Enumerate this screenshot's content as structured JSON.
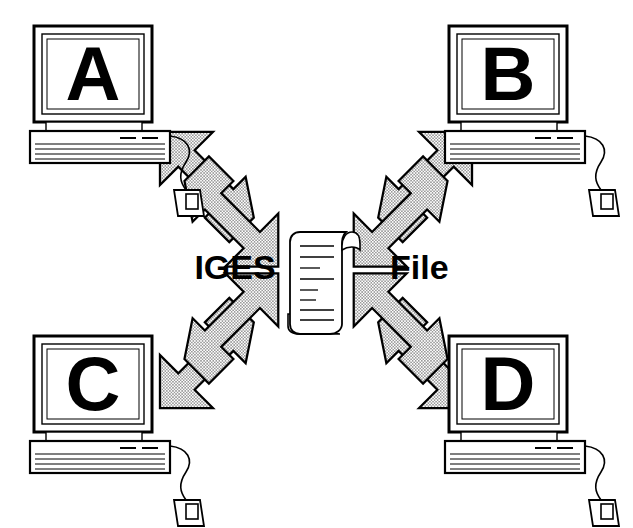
{
  "diagram": {
    "background_color": "#ffffff",
    "ink_color": "#000000",
    "arrow_fill_color": "#d8d8d8",
    "arrow_pattern": "halftone-dots",
    "labels": {
      "left": "IGES",
      "right": "File"
    },
    "center_icon": {
      "name": "scroll-document-icon",
      "description": "curled paper scroll with text lines",
      "text_line_count": 8
    },
    "nodes": [
      {
        "id": "A",
        "screen_letter": "A",
        "name": "computer-a",
        "position": "top-left",
        "x": 28,
        "y": 24,
        "has_mouse": true,
        "has_keyboard_base": true
      },
      {
        "id": "B",
        "screen_letter": "B",
        "name": "computer-b",
        "position": "top-right",
        "x": 443,
        "y": 24,
        "has_mouse": true,
        "has_keyboard_base": true
      },
      {
        "id": "C",
        "screen_letter": "C",
        "name": "computer-c",
        "position": "bottom-left",
        "x": 28,
        "y": 334,
        "has_mouse": true,
        "has_keyboard_base": true
      },
      {
        "id": "D",
        "screen_letter": "D",
        "name": "computer-d",
        "position": "bottom-right",
        "x": 443,
        "y": 334,
        "has_mouse": true,
        "has_keyboard_base": true
      }
    ],
    "connections": [
      {
        "name": "link-a",
        "node": "A",
        "quadrant": "top-left",
        "bidirectional": true,
        "directions": [
          "to-center",
          "to-node"
        ]
      },
      {
        "name": "link-b",
        "node": "B",
        "quadrant": "top-right",
        "bidirectional": true,
        "directions": [
          "to-center",
          "to-node"
        ]
      },
      {
        "name": "link-c",
        "node": "C",
        "quadrant": "bottom-left",
        "bidirectional": true,
        "directions": [
          "to-center",
          "to-node"
        ]
      },
      {
        "name": "link-d",
        "node": "D",
        "quadrant": "bottom-right",
        "bidirectional": true,
        "directions": [
          "to-center",
          "to-node"
        ]
      }
    ]
  }
}
